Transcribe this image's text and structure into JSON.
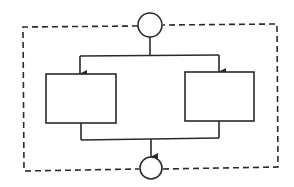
{
  "diagram": {
    "type": "parallel-flow",
    "colors": {
      "stroke": "#2a2a2a",
      "background": "#ffffff"
    },
    "nodes": [
      {
        "id": "start",
        "shape": "circle",
        "label": ""
      },
      {
        "id": "branch-left",
        "shape": "rectangle",
        "label": ""
      },
      {
        "id": "branch-right",
        "shape": "rectangle",
        "label": ""
      },
      {
        "id": "end",
        "shape": "circle",
        "label": ""
      }
    ],
    "edges": [
      {
        "from": "start",
        "to": "branch-left",
        "arrow": true
      },
      {
        "from": "start",
        "to": "branch-right",
        "arrow": true
      },
      {
        "from": "branch-left",
        "to": "end",
        "arrow": true
      },
      {
        "from": "branch-right",
        "to": "end",
        "arrow": true
      }
    ],
    "boundary": {
      "style": "dashed",
      "label": ""
    }
  }
}
